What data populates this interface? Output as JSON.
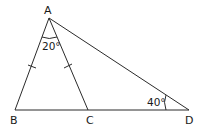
{
  "diagram": {
    "type": "geometry-triangle",
    "points": {
      "A": {
        "label": "A",
        "x": 49,
        "y": 18
      },
      "B": {
        "label": "B",
        "x": 15,
        "y": 110
      },
      "C": {
        "label": "C",
        "x": 88,
        "y": 110
      },
      "D": {
        "label": "D",
        "x": 189,
        "y": 110
      }
    },
    "segments": [
      "AB",
      "AC",
      "AD",
      "BD"
    ],
    "equal_marks": [
      "AB",
      "AC"
    ],
    "angles": [
      {
        "at": "A",
        "between": "BAC",
        "label": "20°"
      },
      {
        "at": "D",
        "between": "ADC",
        "label": "40°"
      }
    ],
    "stroke_color": "#2b2b2b"
  }
}
